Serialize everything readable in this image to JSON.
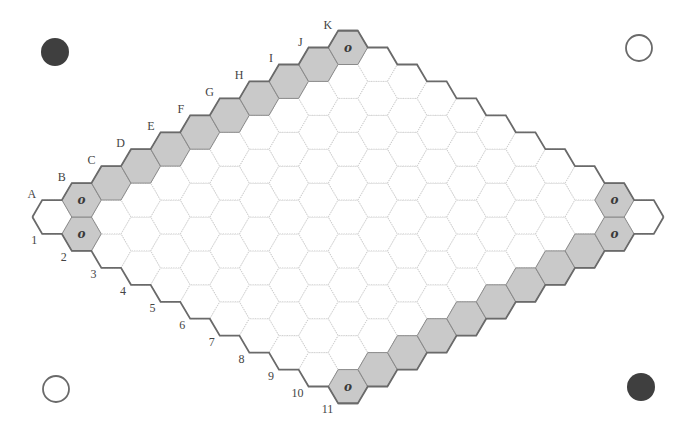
{
  "board": {
    "game": "Hex",
    "size": 11,
    "columns": [
      "A",
      "B",
      "C",
      "D",
      "E",
      "F",
      "G",
      "H",
      "I",
      "J",
      "K"
    ],
    "rows": [
      "1",
      "2",
      "3",
      "4",
      "5",
      "6",
      "7",
      "8",
      "9",
      "10",
      "11"
    ],
    "geometry": {
      "origin_x": 52,
      "origin_y": 217,
      "step_x": 29.6,
      "step_y": 16.95,
      "hex_radius": 19.6
    },
    "shaded_cells": [
      "B1",
      "C1",
      "D1",
      "E1",
      "F1",
      "G1",
      "H1",
      "I1",
      "J1",
      "K1",
      "A2",
      "K10",
      "A11",
      "B11",
      "C11",
      "D11",
      "E11",
      "F11",
      "G11",
      "H11",
      "I11",
      "J11"
    ],
    "marked_cells": [
      {
        "cell": "B1",
        "mark": "o"
      },
      {
        "cell": "A2",
        "mark": "o"
      },
      {
        "cell": "K1",
        "mark": "o"
      },
      {
        "cell": "A11",
        "mark": "o"
      },
      {
        "cell": "K10",
        "mark": "o"
      },
      {
        "cell": "J11",
        "mark": "o"
      }
    ],
    "colors": {
      "shaded": "#c9c9c9",
      "border": "#6a6a6a",
      "grid": "#c8c8c8",
      "mark": "#3a3a3a"
    }
  },
  "corner_stones": [
    {
      "position": "top-left",
      "color": "black",
      "cx": 55,
      "cy": 52,
      "r": 14
    },
    {
      "position": "top-right",
      "color": "white",
      "cx": 639,
      "cy": 48,
      "r": 13
    },
    {
      "position": "bottom-left",
      "color": "white",
      "cx": 56,
      "cy": 389,
      "r": 13
    },
    {
      "position": "bottom-right",
      "color": "black",
      "cx": 641,
      "cy": 387,
      "r": 14
    }
  ]
}
